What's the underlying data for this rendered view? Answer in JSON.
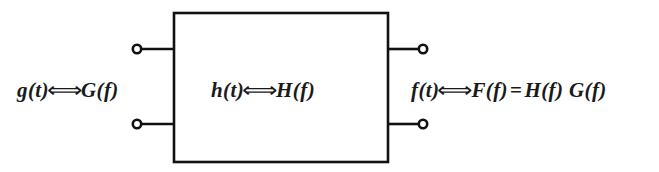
{
  "figure": {
    "type": "block-diagram",
    "background_color": "#ffffff",
    "stroke_color": "#111111"
  },
  "labels": {
    "input": {
      "text": "g(t) ⟺ G(f)",
      "fn_time": "g(t)",
      "operator": "⟺",
      "fn_freq": "G(f)"
    },
    "system": {
      "text": "h(t) ⟺ H(f)",
      "fn_time": "h(t)",
      "operator": "⟺",
      "fn_freq": "H(f)"
    },
    "output": {
      "text": "f(t) ⟺ F(f) = H(f) G(f)",
      "fn_time": "f(t)",
      "operator": "⟺",
      "fn_freq": "F(f)",
      "equals": "=",
      "product": "H(f) G(f)"
    }
  },
  "block": {
    "name": "system-block",
    "x": 174,
    "y": 13,
    "width": 214,
    "height": 149
  },
  "terminals": [
    {
      "name": "input-terminal-top",
      "cx": 137,
      "cy": 49,
      "r": 4
    },
    {
      "name": "input-terminal-bottom",
      "cx": 137,
      "cy": 124,
      "r": 4
    },
    {
      "name": "output-terminal-top",
      "cx": 423,
      "cy": 49,
      "r": 4
    },
    {
      "name": "output-terminal-bottom",
      "cx": 423,
      "cy": 124,
      "r": 4
    }
  ],
  "leads": [
    {
      "name": "input-lead-top",
      "x1": 141,
      "y1": 49,
      "x2": 174,
      "y2": 49
    },
    {
      "name": "input-lead-bottom",
      "x1": 141,
      "y1": 124,
      "x2": 174,
      "y2": 124
    },
    {
      "name": "output-lead-top",
      "x1": 388,
      "y1": 49,
      "x2": 419,
      "y2": 49
    },
    {
      "name": "output-lead-bottom",
      "x1": 388,
      "y1": 124,
      "x2": 419,
      "y2": 124
    }
  ]
}
